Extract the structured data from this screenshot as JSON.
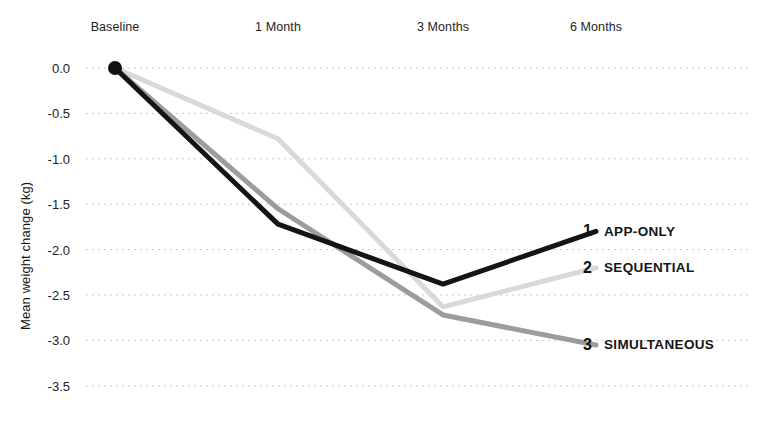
{
  "chart_data": {
    "type": "line",
    "title": "",
    "xlabel": "",
    "ylabel": "Mean weight change (kg)",
    "categories": [
      "Baseline",
      "1 Month",
      "3 Months",
      "6 Months"
    ],
    "yticks": [
      "0.0",
      "-0.5",
      "-1.0",
      "-1.5",
      "-2.0",
      "-2.5",
      "-3.0",
      "-3.5"
    ],
    "ytick_values": [
      0.0,
      -0.5,
      -1.0,
      -1.5,
      -2.0,
      -2.5,
      -3.0,
      -3.5
    ],
    "ylim": [
      -3.5,
      0.0
    ],
    "grid": "horizontal-dotted",
    "legend_position": "right-inline-end-of-line",
    "series": [
      {
        "name": "APP-ONLY",
        "rank": "1",
        "color": "#141414",
        "width": 5,
        "values": [
          0.0,
          -1.72,
          -2.38,
          -1.8
        ]
      },
      {
        "name": "SEQUENTIAL",
        "rank": "2",
        "color": "#d9d9d9",
        "width": 5,
        "values": [
          0.0,
          -0.78,
          -2.63,
          -2.2
        ]
      },
      {
        "name": "SIMULTANEOUS",
        "rank": "3",
        "color": "#9c9c9c",
        "width": 5,
        "values": [
          0.0,
          -1.55,
          -2.72,
          -3.05
        ]
      }
    ],
    "markers": [
      {
        "category": "Baseline",
        "value": 0.0,
        "color": "#111111",
        "radius": 7
      }
    ]
  },
  "geometry": {
    "x_positions": [
      115,
      278,
      443,
      596
    ],
    "y_top": 68,
    "y_step": 45.4,
    "gridline_x_start": 86,
    "gridline_x_end": 752,
    "legend_x": 583,
    "legend_label_x": 608
  }
}
